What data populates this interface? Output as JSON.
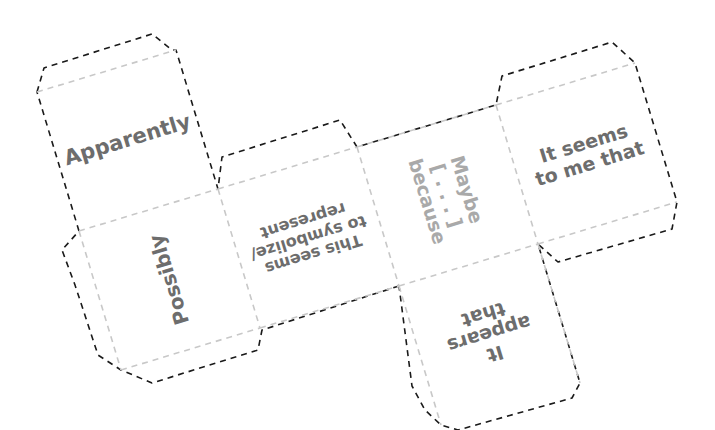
{
  "colors": {
    "cut_line": "#1a1a1a",
    "fold_line": "#c8c8c8",
    "text_dark": "#6d6d6d",
    "text_light": "#a9a9a9",
    "background": "#ffffff"
  },
  "faces": [
    {
      "id": "apparently",
      "text": "Apparently",
      "orientation": "upright"
    },
    {
      "id": "possibly",
      "text": "Possibly",
      "orientation": "rotated-90"
    },
    {
      "id": "this-seems",
      "text": "This seems\nto symbolize/\nrepresent",
      "orientation": "upside-down"
    },
    {
      "id": "maybe",
      "text": "Maybe\n[ . . . ]\nbecause",
      "orientation": "rotated-90"
    },
    {
      "id": "it-seems",
      "text": "It seems\nto me that",
      "orientation": "upright"
    },
    {
      "id": "it-appears",
      "text": "It\nappears\nthat",
      "orientation": "upside-down"
    }
  ]
}
